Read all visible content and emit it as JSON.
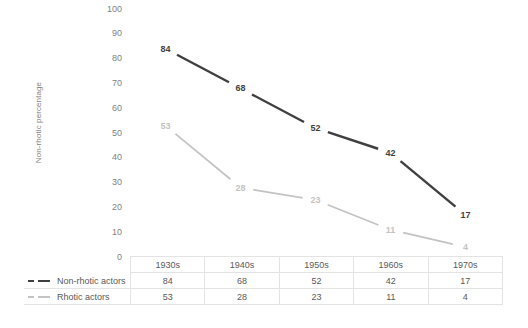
{
  "chart_data": {
    "type": "line",
    "title": "",
    "xlabel": "",
    "ylabel": "Non-rhotic percentage",
    "ylim": [
      0,
      100
    ],
    "ytick_step": 10,
    "grid": false,
    "legend_position": "table-left",
    "categories": [
      "1930s",
      "1940s",
      "1950s",
      "1960s",
      "1970s"
    ],
    "series": [
      {
        "name": "Non-rhotic actors",
        "color": "#3f3f3f",
        "values": [
          84,
          68,
          52,
          42,
          17
        ]
      },
      {
        "name": "Rhotic actors",
        "color": "#c3c3c3",
        "values": [
          53,
          28,
          23,
          11,
          4
        ]
      }
    ],
    "yticks": [
      "0",
      "10",
      "20",
      "30",
      "40",
      "50",
      "60",
      "70",
      "80",
      "90",
      "100"
    ]
  },
  "table": {
    "corner_label": "",
    "row_header_labels": [
      "Non-rhotic actors",
      "Rhotic actors"
    ]
  }
}
